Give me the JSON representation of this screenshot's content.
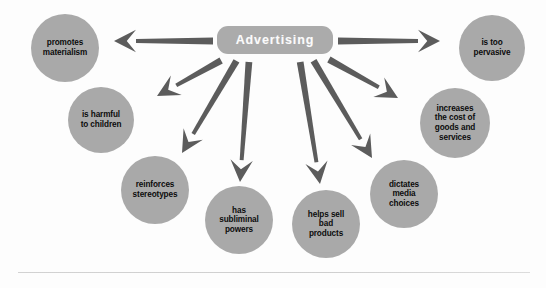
{
  "diagram": {
    "center": {
      "label": "Advertising",
      "shape": "rounded-rectangle",
      "fill": "#ababab",
      "text_color": "#fbfbfb",
      "x": 217,
      "y": 26,
      "w": 116,
      "h": 28,
      "font_size": 12.5
    },
    "node_fill": "#a9a9a9",
    "node_text_color": "#0c0c0c",
    "arrow_color": "#5c5c5c",
    "background": "#fdfdfd",
    "nodes": [
      {
        "id": "promotes-materialism",
        "lines": [
          "promotes",
          "materialism"
        ],
        "cx": 65,
        "cy": 48,
        "r": 34,
        "font_size": 8.2
      },
      {
        "id": "is-harmful-to-children",
        "lines": [
          "is harmful",
          "to children"
        ],
        "cx": 101,
        "cy": 120,
        "r": 33,
        "font_size": 8.2
      },
      {
        "id": "reinforces-stereotypes",
        "lines": [
          "reinforces",
          "stereotypes"
        ],
        "cx": 155,
        "cy": 190,
        "r": 34,
        "font_size": 8.2
      },
      {
        "id": "has-subliminal-powers",
        "lines": [
          "has",
          "subliminal",
          "powers"
        ],
        "cx": 239,
        "cy": 220,
        "r": 34,
        "font_size": 8.2
      },
      {
        "id": "helps-sell-bad-products",
        "lines": [
          "helps sell",
          "bad",
          "products"
        ],
        "cx": 326,
        "cy": 224,
        "r": 34,
        "font_size": 8.2
      },
      {
        "id": "dictates-media-choices",
        "lines": [
          "dictates",
          "media",
          "choices"
        ],
        "cx": 404,
        "cy": 194,
        "r": 34,
        "font_size": 8.2
      },
      {
        "id": "increases-cost-of-goods",
        "lines": [
          "increases",
          "the cost of",
          "goods and",
          "services"
        ],
        "cx": 455,
        "cy": 123,
        "r": 35,
        "font_size": 8.2
      },
      {
        "id": "is-too-pervasive",
        "lines": [
          "is too",
          "pervasive"
        ],
        "cx": 492,
        "cy": 48,
        "r": 33,
        "font_size": 8.2
      }
    ],
    "arrows": [
      {
        "id": "arrow-to-promotes-materialism",
        "x1": 214,
        "y1": 41,
        "x2": 114,
        "y2": 41,
        "width": 6.5
      },
      {
        "id": "arrow-to-is-harmful-to-children",
        "x1": 222,
        "y1": 60,
        "x2": 157,
        "y2": 96,
        "width": 6.5
      },
      {
        "id": "arrow-to-reinforces-stereotypes",
        "x1": 237,
        "y1": 60,
        "x2": 182,
        "y2": 153,
        "width": 6.5
      },
      {
        "id": "arrow-to-has-subliminal-powers",
        "x1": 249,
        "y1": 61,
        "x2": 240,
        "y2": 182,
        "width": 6.5
      },
      {
        "id": "arrow-to-helps-sell-bad-products",
        "x1": 300,
        "y1": 61,
        "x2": 320,
        "y2": 184,
        "width": 6.5
      },
      {
        "id": "arrow-to-dictates-media-choices",
        "x1": 313,
        "y1": 60,
        "x2": 372,
        "y2": 158,
        "width": 6.5
      },
      {
        "id": "arrow-to-increases-cost",
        "x1": 328,
        "y1": 59,
        "x2": 398,
        "y2": 98,
        "width": 6.5
      },
      {
        "id": "arrow-to-is-too-pervasive",
        "x1": 337,
        "y1": 41,
        "x2": 440,
        "y2": 41,
        "width": 6.5
      }
    ],
    "bottom_rule": {
      "visible": true,
      "color": "#d2d2d2"
    }
  }
}
